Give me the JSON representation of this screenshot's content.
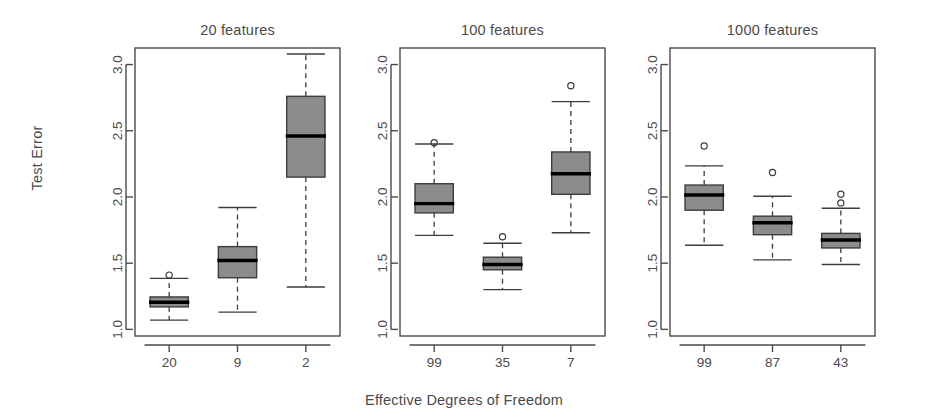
{
  "figure": {
    "xlabel": "Effective Degrees of Freedom",
    "ylabel": "Test Error"
  },
  "axis": {
    "y_ticks": [
      "1.0",
      "1.5",
      "2.0",
      "2.5",
      "3.0"
    ],
    "y_tick_values": [
      1.0,
      1.5,
      2.0,
      2.5,
      3.0
    ]
  },
  "panels": [
    {
      "title": "20 features",
      "x_ticks": [
        "20",
        "9",
        "2"
      ]
    },
    {
      "title": "100 features",
      "x_ticks": [
        "99",
        "35",
        "7"
      ]
    },
    {
      "title": "1000 features",
      "x_ticks": [
        "99",
        "87",
        "43"
      ]
    }
  ],
  "chart_data": {
    "type": "box",
    "title": "",
    "subtitle": "",
    "xlabel": "Effective Degrees of Freedom",
    "ylabel": "Test Error",
    "ylim": [
      0.95,
      3.1
    ],
    "yticks": [
      1.0,
      1.5,
      2.0,
      2.5,
      3.0
    ],
    "grid": false,
    "legend": "none",
    "panels": [
      {
        "panel_title": "20 features",
        "categories": [
          "20",
          "9",
          "2"
        ],
        "boxes": [
          {
            "category": "20",
            "whisker_low": 1.07,
            "q1": 1.17,
            "median": 1.205,
            "q3": 1.245,
            "whisker_high": 1.385,
            "outliers": [
              1.41
            ]
          },
          {
            "category": "9",
            "whisker_low": 1.13,
            "q1": 1.39,
            "median": 1.52,
            "q3": 1.625,
            "whisker_high": 1.92,
            "outliers": []
          },
          {
            "category": "2",
            "whisker_low": 1.32,
            "q1": 2.15,
            "median": 2.46,
            "q3": 2.76,
            "whisker_high": 3.08,
            "outliers": []
          }
        ]
      },
      {
        "panel_title": "100 features",
        "categories": [
          "99",
          "35",
          "7"
        ],
        "boxes": [
          {
            "category": "99",
            "whisker_low": 1.71,
            "q1": 1.88,
            "median": 1.95,
            "q3": 2.1,
            "whisker_high": 2.4,
            "outliers": [
              2.41
            ]
          },
          {
            "category": "35",
            "whisker_low": 1.3,
            "q1": 1.45,
            "median": 1.49,
            "q3": 1.545,
            "whisker_high": 1.65,
            "outliers": [
              1.7
            ]
          },
          {
            "category": "7",
            "whisker_low": 1.73,
            "q1": 2.02,
            "median": 2.175,
            "q3": 2.34,
            "whisker_high": 2.72,
            "outliers": [
              2.84
            ]
          }
        ]
      },
      {
        "panel_title": "1000 features",
        "categories": [
          "99",
          "87",
          "43"
        ],
        "boxes": [
          {
            "category": "99",
            "whisker_low": 1.635,
            "q1": 1.9,
            "median": 2.015,
            "q3": 2.09,
            "whisker_high": 2.235,
            "outliers": [
              2.385
            ]
          },
          {
            "category": "87",
            "whisker_low": 1.525,
            "q1": 1.715,
            "median": 1.805,
            "q3": 1.855,
            "whisker_high": 2.005,
            "outliers": [
              2.185
            ]
          },
          {
            "category": "43",
            "whisker_low": 1.49,
            "q1": 1.615,
            "median": 1.675,
            "q3": 1.725,
            "whisker_high": 1.915,
            "outliers": [
              1.955,
              2.02
            ]
          }
        ]
      }
    ]
  },
  "style": {
    "box_fill": "#8c8c8c",
    "box_stroke": "#3d3d3d",
    "median_stroke": "#000000",
    "axis_color": "#4a4a4a",
    "text_color": "#4a4a4a",
    "background": "#ffffff"
  }
}
